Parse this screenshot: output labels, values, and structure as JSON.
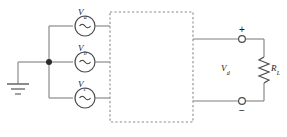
{
  "figure": {
    "type": "circuit-schematic"
  },
  "sources": [
    {
      "id": "source-a",
      "symbol": "ac-source",
      "label_main": "V",
      "label_sub": "a",
      "glyph": "∼",
      "cx": 85,
      "cy": 26
    },
    {
      "id": "source-b",
      "symbol": "ac-source",
      "label_main": "V",
      "label_sub": "b",
      "glyph": "∼",
      "cx": 85,
      "cy": 62
    },
    {
      "id": "source-c",
      "symbol": "ac-source",
      "label_main": "V",
      "label_sub": "c",
      "glyph": "∼",
      "cx": 85,
      "cy": 98
    }
  ],
  "ground": {
    "name": "earth-ground",
    "x": 18,
    "y": 62
  },
  "junction": {
    "name": "neutral-node",
    "x": 49,
    "y": 62
  },
  "converter": {
    "name": "converter-block",
    "style": "dashed-rectangle",
    "x": 110,
    "y": 12,
    "width": 83,
    "height": 110,
    "label": ""
  },
  "output": {
    "voltage_main": "V",
    "voltage_sub": "d",
    "plus_sign": "+",
    "minus_sign": "−",
    "terminal_plus": {
      "name": "positive-terminal",
      "cx": 242,
      "cy": 39
    },
    "terminal_minus": {
      "name": "negative-terminal",
      "cx": 242,
      "cy": 101
    }
  },
  "load": {
    "symbol": "resistor",
    "label_main": "R",
    "label_sub": "L",
    "cx": 264,
    "cy": 70
  },
  "colors": {
    "wire": "#808080",
    "dashed_box": "#808080",
    "symbol_outline": "#4d4d4d",
    "text": "#1a1a1a",
    "background": "#ffffff"
  }
}
